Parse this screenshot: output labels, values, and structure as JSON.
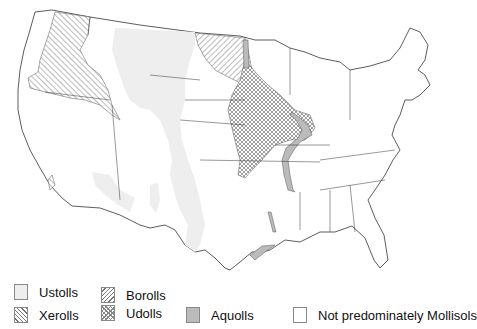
{
  "map": {
    "title": "",
    "region": "Contiguous United States",
    "subject": "Distribution of Mollisol suborders",
    "colors": {
      "ustolls": "#eeeeee",
      "borolls_hatch": "#777777",
      "xerolls_hatch": "#777777",
      "udolls_crosshatch": "#888888",
      "aquolls": "#bbbbbb",
      "none": "#ffffff",
      "boundary": "#333333"
    }
  },
  "legend": {
    "items": [
      {
        "id": "ustolls",
        "label": "Ustolls",
        "pattern": "light-gray-fill"
      },
      {
        "id": "borolls",
        "label": "Borolls",
        "pattern": "diagonal-hatch-right"
      },
      {
        "id": "xerolls",
        "label": "Xerolls",
        "pattern": "diagonal-hatch-left"
      },
      {
        "id": "udolls",
        "label": "Udolls",
        "pattern": "cross-hatch"
      },
      {
        "id": "aquolls",
        "label": "Aquolls",
        "pattern": "medium-gray-fill"
      },
      {
        "id": "none",
        "label": "Not predominately Mollisols",
        "pattern": "white-fill"
      }
    ]
  }
}
